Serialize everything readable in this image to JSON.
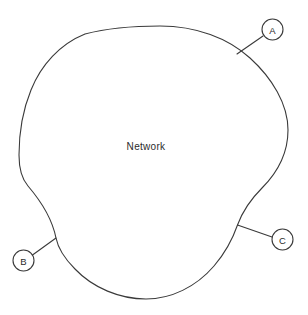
{
  "diagram": {
    "type": "network-boundary-diagram",
    "background_color": "#ffffff",
    "stroke_color": "#3a3a3a",
    "text_color": "#2b2b2b",
    "region": {
      "label": "Network",
      "label_x": 146,
      "label_y": 146
    },
    "nodes": [
      {
        "id": "A",
        "label": "A",
        "circle_x": 272.5,
        "circle_y": 29.5,
        "circle_r": 10.5,
        "leader_from_x": 263.0,
        "leader_from_y": 36.0,
        "leader_to_x": 237.0,
        "leader_to_y": 54.0
      },
      {
        "id": "B",
        "label": "B",
        "circle_x": 23.5,
        "circle_y": 260.5,
        "circle_r": 10.5,
        "leader_from_x": 32.5,
        "leader_from_y": 255.0,
        "leader_to_x": 56.0,
        "leader_to_y": 238.0
      },
      {
        "id": "C",
        "label": "C",
        "circle_x": 282.5,
        "circle_y": 239.5,
        "circle_r": 10.5,
        "leader_from_x": 272.0,
        "leader_from_y": 237.0,
        "leader_to_x": 237.5,
        "leader_to_y": 225.0
      }
    ]
  }
}
